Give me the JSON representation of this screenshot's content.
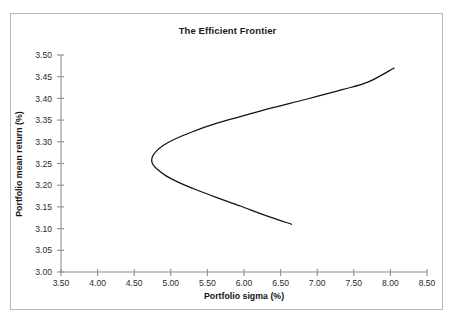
{
  "chart_data": {
    "type": "line",
    "title": "The Efficient Frontier",
    "xlabel": "Portfolio sigma (%)",
    "ylabel": "Portfolio mean return (%)",
    "xlim": [
      3.5,
      8.5
    ],
    "ylim": [
      3.0,
      3.5
    ],
    "grid": false,
    "legend": "none",
    "xticks": [
      "3.50",
      "4.00",
      "4.50",
      "5.00",
      "5.50",
      "6.00",
      "6.50",
      "7.00",
      "7.50",
      "8.00",
      "8.50"
    ],
    "yticks": [
      "3.00",
      "3.05",
      "3.10",
      "3.15",
      "3.20",
      "3.25",
      "3.30",
      "3.35",
      "3.40",
      "3.45",
      "3.50"
    ],
    "xtick_values": [
      3.5,
      4.0,
      4.5,
      5.0,
      5.5,
      6.0,
      6.5,
      7.0,
      7.5,
      8.0,
      8.5
    ],
    "ytick_values": [
      3.0,
      3.05,
      3.1,
      3.15,
      3.2,
      3.25,
      3.3,
      3.35,
      3.4,
      3.45,
      3.5
    ],
    "curve_color": "#121212",
    "axis_color": "#8e8e8e",
    "series": [
      {
        "name": "Efficient frontier",
        "note": "minimum-variance hyperbola; vertex at sigma 4.74, return 3.255",
        "vertex": {
          "sigma": 4.74,
          "return": 3.255
        },
        "upper_branch_end": {
          "sigma": 8.05,
          "return": 3.47
        },
        "lower_branch_end": {
          "sigma": 6.65,
          "return": 3.11
        },
        "points": [
          {
            "sigma": 6.65,
            "return": 3.11
          },
          {
            "sigma": 6.3,
            "return": 3.13
          },
          {
            "sigma": 5.95,
            "return": 3.152
          },
          {
            "sigma": 5.62,
            "return": 3.172
          },
          {
            "sigma": 5.34,
            "return": 3.19
          },
          {
            "sigma": 5.1,
            "return": 3.207
          },
          {
            "sigma": 4.93,
            "return": 3.222
          },
          {
            "sigma": 4.82,
            "return": 3.236
          },
          {
            "sigma": 4.76,
            "return": 3.247
          },
          {
            "sigma": 4.74,
            "return": 3.255
          },
          {
            "sigma": 4.75,
            "return": 3.266
          },
          {
            "sigma": 4.8,
            "return": 3.278
          },
          {
            "sigma": 4.9,
            "return": 3.292
          },
          {
            "sigma": 5.05,
            "return": 3.306
          },
          {
            "sigma": 5.28,
            "return": 3.322
          },
          {
            "sigma": 5.58,
            "return": 3.34
          },
          {
            "sigma": 5.95,
            "return": 3.358
          },
          {
            "sigma": 6.38,
            "return": 3.378
          },
          {
            "sigma": 6.85,
            "return": 3.398
          },
          {
            "sigma": 7.34,
            "return": 3.42
          },
          {
            "sigma": 7.7,
            "return": 3.438
          },
          {
            "sigma": 8.05,
            "return": 3.47
          }
        ]
      }
    ]
  }
}
